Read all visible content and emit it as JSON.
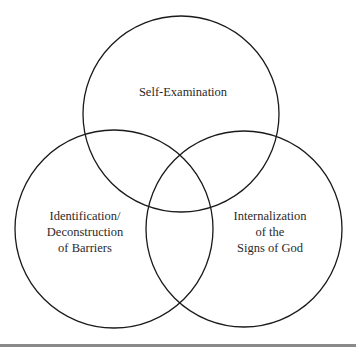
{
  "diagram": {
    "type": "venn",
    "sets": [
      {
        "id": "top",
        "label": "Self-Examination",
        "lines": [
          "Self-Examination"
        ]
      },
      {
        "id": "left",
        "label": "Identification/ Deconstruction of Barriers",
        "lines": [
          "Identification/",
          "Deconstruction",
          "of Barriers"
        ]
      },
      {
        "id": "right",
        "label": "Internalization of the Signs of God",
        "lines": [
          "Internalization",
          "of the",
          "Signs of God"
        ]
      }
    ],
    "colors": {
      "stroke": "#1a1a1a",
      "text": "#2a2a2a",
      "background": "#ffffff",
      "bottom_rule": "#8a8a8a"
    }
  }
}
